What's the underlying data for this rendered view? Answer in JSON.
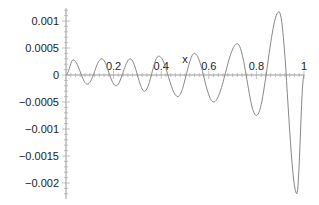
{
  "chart_data": {
    "type": "line",
    "title": "",
    "xlabel": "x",
    "ylabel": "",
    "xlim": [
      0,
      1
    ],
    "ylim": [
      -0.0022,
      0.0012
    ],
    "grid": false,
    "legend": null,
    "x_ticks": [
      "0.2",
      "0.4",
      "0.6",
      "0.8",
      "1"
    ],
    "y_ticks": [
      "0.001",
      "0.0005",
      "0",
      "-0.0005",
      "-0.001",
      "-0.0015",
      "-0.002"
    ],
    "series": [
      {
        "name": "f(x)",
        "color": "#888888",
        "x": [
          0.0,
          0.03,
          0.09,
          0.15,
          0.21,
          0.27,
          0.33,
          0.39,
          0.47,
          0.54,
          0.62,
          0.72,
          0.8,
          0.895,
          0.97,
          1.0
        ],
        "y": [
          0.0,
          0.00028,
          -0.00017,
          0.0003,
          -0.0002,
          0.0003,
          -0.0003,
          0.00035,
          -0.0004,
          0.0004,
          -0.0005,
          0.00058,
          -0.00075,
          0.00117,
          -0.0022,
          0.0
        ]
      }
    ]
  }
}
